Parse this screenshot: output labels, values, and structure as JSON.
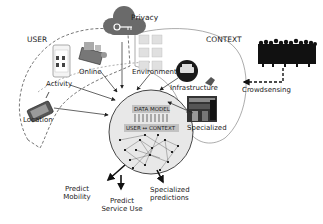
{
  "diagram": {
    "regions": {
      "user": "USER",
      "context": "CONTEXT",
      "privacy": "Privacy"
    },
    "user_sources": [
      {
        "label": "Activity",
        "icon": "smartphone-activity-icon"
      },
      {
        "label": "Online",
        "icon": "online-services-icon"
      },
      {
        "label": "Location",
        "icon": "gps-device-icon"
      }
    ],
    "context_sources": [
      {
        "label": "Environment",
        "icon": "weather-grid-icon"
      },
      {
        "label": "Infrastructure",
        "icon": "car-infrastructure-icon"
      },
      {
        "label": "Specialized",
        "icon": "vacancies-board-icon"
      }
    ],
    "privacy_icon": "cloud-key-icon",
    "crowd": {
      "label": "Crowdsensing",
      "icon": "crowd-icon"
    },
    "core": {
      "title": "DATA MODEL",
      "subtitle": "USER ↔ CONTEXT",
      "graph_icon": "network-graph-icon"
    },
    "outputs": [
      {
        "line1": "Predict",
        "line2": "Mobility"
      },
      {
        "line1": "Predict",
        "line2": "Service Use"
      },
      {
        "line1": "Specialized",
        "line2": "predictions"
      }
    ],
    "colors": {
      "privacy_cloud": "#6a6a6a",
      "core_fill": "#e6e6e6",
      "core_label_fill": "#bdbdbd",
      "crowd": "#111111",
      "line": "#222222"
    }
  }
}
